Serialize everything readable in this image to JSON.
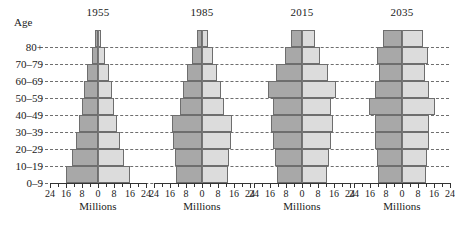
{
  "figure": {
    "age_axis_title": "Age",
    "age_groups": [
      "80+",
      "70–79",
      "60–69",
      "50–59",
      "40–49",
      "30–39",
      "20–29",
      "10–19",
      "0–9"
    ],
    "x_axis_title": "Millions",
    "x_tick_labels": [
      "24",
      "16",
      "8",
      "0",
      "8",
      "16",
      "24"
    ],
    "x_tick_values": [
      -24,
      -16,
      -8,
      0,
      8,
      16,
      24
    ],
    "x_minor_step": 4,
    "colors": {
      "left_bar": "#a8a8a8",
      "right_bar": "#dcdcdc",
      "bar_outline": "#6e6e6e",
      "gridline": "#555555",
      "axis": "#333333",
      "background": "#ffffff",
      "text": "#1a1a1a"
    }
  },
  "chart_data": {
    "type": "bar",
    "subtype": "population-pyramid",
    "categories": [
      "80+",
      "70–79",
      "60–69",
      "50–59",
      "40–49",
      "30–39",
      "20–29",
      "10–19",
      "0–9"
    ],
    "xlabel": "Millions",
    "ylabel": "Age",
    "xlim": [
      -24,
      24
    ],
    "x_ticks": [
      -24,
      -16,
      -8,
      0,
      8,
      16,
      24
    ],
    "x_tick_labels": [
      "24",
      "16",
      "8",
      "0",
      "8",
      "16",
      "24"
    ],
    "grid": true,
    "legend": "none",
    "panels": [
      {
        "title": "1955",
        "series": [
          {
            "name": "Male",
            "side": "left",
            "values": [
              1.5,
              3.0,
              5.5,
              7.0,
              8.0,
              9.5,
              11.0,
              13.0,
              16.0
            ]
          },
          {
            "name": "Female",
            "side": "right",
            "values": [
              1.5,
              3.5,
              5.5,
              7.0,
              8.0,
              9.5,
              11.0,
              13.0,
              16.0
            ]
          }
        ]
      },
      {
        "title": "1985",
        "series": [
          {
            "name": "Male",
            "side": "left",
            "values": [
              2.5,
              5.0,
              7.5,
              9.5,
              11.0,
              15.0,
              14.5,
              13.5,
              13.0
            ]
          },
          {
            "name": "Female",
            "side": "right",
            "values": [
              3.0,
              5.5,
              7.5,
              9.5,
              11.0,
              15.0,
              14.5,
              13.5,
              13.0
            ]
          }
        ]
      },
      {
        "title": "2015",
        "series": [
          {
            "name": "Male",
            "side": "left",
            "values": [
              5.5,
              8.5,
              13.0,
              17.0,
              14.5,
              15.5,
              14.5,
              13.5,
              12.5
            ]
          },
          {
            "name": "Female",
            "side": "right",
            "values": [
              6.5,
              9.0,
              13.0,
              17.0,
              14.5,
              15.5,
              14.5,
              13.5,
              12.5
            ]
          }
        ]
      },
      {
        "title": "2035",
        "series": [
          {
            "name": "Male",
            "side": "left",
            "values": [
              9.5,
              12.5,
              11.5,
              13.5,
              16.5,
              13.5,
              13.5,
              12.5,
              12.0
            ]
          },
          {
            "name": "Female",
            "side": "right",
            "values": [
              10.5,
              13.0,
              11.5,
              13.5,
              16.5,
              13.5,
              13.5,
              12.5,
              12.0
            ]
          }
        ]
      }
    ]
  }
}
